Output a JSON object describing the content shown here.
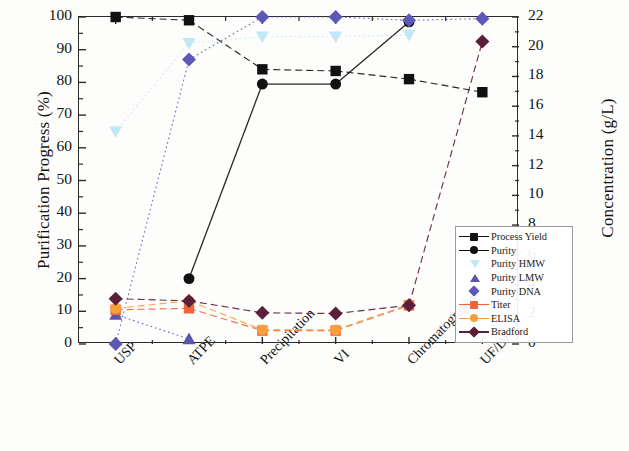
{
  "chart_data": {
    "type": "line",
    "title": "",
    "xlabel": "",
    "categories": [
      "USP",
      "ATPE",
      "Precipitation",
      "VI",
      "Chromatography",
      "UF/DF"
    ],
    "ylabel": "Purification Progress (%)",
    "ylim": [
      0,
      100
    ],
    "yticks": [
      0,
      10,
      20,
      30,
      40,
      50,
      60,
      70,
      80,
      90,
      100
    ],
    "y2label": "Concentration (g/L)",
    "y2lim": [
      0,
      22
    ],
    "y2ticks": [
      0,
      2,
      4,
      6,
      8,
      10,
      12,
      14,
      16,
      18,
      20,
      22
    ],
    "grid": false,
    "legend_position": "lower right",
    "series": [
      {
        "name": "Process Yield",
        "axis": "left",
        "marker": "square",
        "color": "#111111",
        "line": "dashed",
        "values": [
          100,
          99,
          84,
          83.5,
          81,
          77
        ]
      },
      {
        "name": "Purity",
        "axis": "left",
        "marker": "circle",
        "color": "#111111",
        "line": "solid",
        "values": [
          null,
          20,
          79.5,
          79.5,
          98.5,
          null
        ]
      },
      {
        "name": "Purity HMW",
        "axis": "left",
        "marker": "triangle-down",
        "color": "#bfe9f5",
        "line": "dotted",
        "values": [
          65,
          92,
          94,
          94,
          94.5,
          null
        ]
      },
      {
        "name": "Purity LMW",
        "axis": "left",
        "marker": "triangle-up",
        "color": "#5a55a8",
        "line": "dotted",
        "values": [
          9,
          1.5,
          null,
          null,
          null,
          null
        ]
      },
      {
        "name": "Purity DNA",
        "axis": "left",
        "marker": "diamond",
        "color": "#5e58b8",
        "line": "dotted",
        "values": [
          0,
          87,
          100,
          100,
          99,
          99.5
        ]
      },
      {
        "name": "Titer",
        "axis": "right",
        "marker": "square",
        "color": "#f2653c",
        "line": "dashed",
        "values": [
          2.3,
          2.4,
          0.9,
          0.9,
          2.6,
          null
        ]
      },
      {
        "name": "ELISA",
        "axis": "right",
        "marker": "circle",
        "color": "#f6a03c",
        "line": "dashed",
        "values": [
          2.4,
          2.9,
          0.95,
          0.95,
          2.65,
          null
        ]
      },
      {
        "name": "Bradford",
        "axis": "right",
        "marker": "diamond",
        "color": "#5a1f3a",
        "line": "dashed",
        "values": [
          3.05,
          2.9,
          2.1,
          2.05,
          2.6,
          20.35
        ]
      }
    ]
  }
}
